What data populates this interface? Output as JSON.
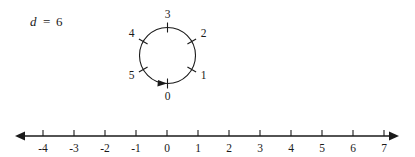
{
  "figure": {
    "modulus_label": {
      "variable": "d",
      "equals": "=",
      "value": "6",
      "full": "d = 6"
    },
    "circle_diagram": {
      "name": "modular-clock-circle",
      "modulus": 6,
      "direction": "clockwise",
      "center_x": 167.5,
      "center_y": 55.5,
      "radius": 28,
      "stroke_color": "#1a1a1a",
      "labels": [
        {
          "text": "0",
          "angle_deg": 90,
          "position": "bottom"
        },
        {
          "text": "1",
          "angle_deg": 30,
          "position": "lower-right"
        },
        {
          "text": "2",
          "angle_deg": 330,
          "position": "upper-right"
        },
        {
          "text": "3",
          "angle_deg": 270,
          "position": "top"
        },
        {
          "text": "4",
          "angle_deg": 210,
          "position": "upper-left"
        },
        {
          "text": "5",
          "angle_deg": 150,
          "position": "lower-left"
        }
      ],
      "arrow": {
        "name": "clockwise-direction-arrow",
        "position": "bottom",
        "points": "right"
      }
    },
    "number_line": {
      "name": "number-line",
      "y": 136,
      "x_start": 17,
      "x_end": 397,
      "zero_x": 167,
      "spacing": 31,
      "stroke_color": "#1a1a1a",
      "arrows_both_ends": true,
      "ticks": [
        "-4",
        "-3",
        "-2",
        "-1",
        "0",
        "1",
        "2",
        "3",
        "4",
        "5",
        "6",
        "7"
      ],
      "tick_values": [
        -4,
        -3,
        -2,
        -1,
        0,
        1,
        2,
        3,
        4,
        5,
        6,
        7
      ]
    }
  }
}
